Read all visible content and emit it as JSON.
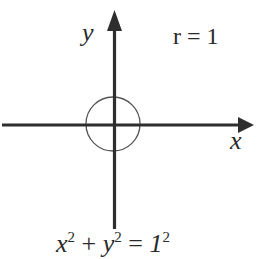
{
  "diagram": {
    "type": "unit-circle-coordinate-plane",
    "colors": {
      "axis": "#2e2e2e",
      "circle": "#555555",
      "text": "#2a2a2a",
      "background": "#ffffff"
    },
    "axes": {
      "x_label": "x",
      "y_label": "y"
    },
    "circle": {
      "radius_label": "r = 1",
      "radius": 1
    },
    "equation": {
      "term1_base": "x",
      "term1_exp": "2",
      "op_plus": " + ",
      "term2_base": "y",
      "term2_exp": "2",
      "op_eq": " = ",
      "rhs_base": "1",
      "rhs_exp": "2",
      "full_text": "x² + y² = 1²"
    }
  }
}
